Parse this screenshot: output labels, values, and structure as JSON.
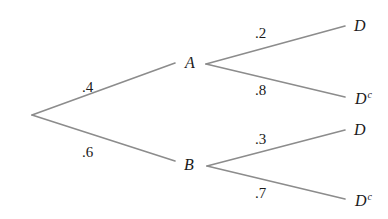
{
  "diagram": {
    "type": "probability-tree",
    "line_color": "#8c8c8c",
    "root": {
      "label": "",
      "branches": [
        {
          "probability": ".4",
          "node": {
            "label": "A",
            "branches": [
              {
                "probability": ".2",
                "node": {
                  "label": "D",
                  "superscript": ""
                }
              },
              {
                "probability": ".8",
                "node": {
                  "label": "D",
                  "superscript": "c"
                }
              }
            ]
          }
        },
        {
          "probability": ".6",
          "node": {
            "label": "B",
            "branches": [
              {
                "probability": ".3",
                "node": {
                  "label": "D",
                  "superscript": ""
                }
              },
              {
                "probability": ".7",
                "node": {
                  "label": "D",
                  "superscript": "c"
                }
              }
            ]
          }
        }
      ]
    }
  }
}
